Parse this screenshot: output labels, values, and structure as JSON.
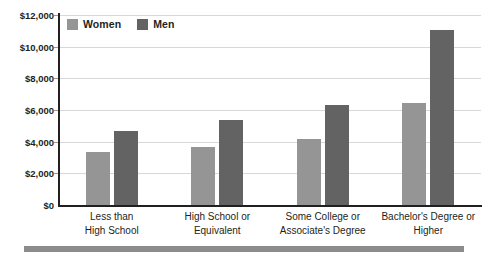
{
  "chart_data": {
    "type": "bar",
    "title": "",
    "subtitle": "",
    "xlabel": "",
    "ylabel": "",
    "ylim": [
      0,
      12000
    ],
    "ytick_values": [
      0,
      2000,
      4000,
      6000,
      8000,
      10000,
      12000
    ],
    "ytick_labels": [
      "$0",
      "$2,000",
      "$4,000",
      "$6,000",
      "$8,000",
      "$10,000",
      "$12,000"
    ],
    "grid": true,
    "legend_position": "top-left",
    "categories": [
      "Less than\nHigh School",
      "High School or\nEquivalent",
      "Some College or\nAssociate's Degree",
      "Bachelor's Degree or\nHigher"
    ],
    "category_lines": [
      [
        "Less than",
        "High School"
      ],
      [
        "High School or",
        "Equivalent"
      ],
      [
        "Some College or",
        "Associate's Degree"
      ],
      [
        "Bachelor's Degree or",
        "Higher"
      ]
    ],
    "series": [
      {
        "name": "Women",
        "color": "#959595",
        "values": [
          3350,
          3650,
          4200,
          6450
        ]
      },
      {
        "name": "Men",
        "color": "#636363",
        "values": [
          4670,
          5350,
          6300,
          11050
        ]
      }
    ]
  },
  "legend": {
    "items": [
      {
        "label": "Women",
        "color": "#959595"
      },
      {
        "label": "Men",
        "color": "#636363"
      }
    ]
  },
  "colors": {
    "women": "#959595",
    "men": "#636363",
    "axis": "#231f20",
    "gridline": "#d8d8d8",
    "rule": "#8c8c8c",
    "background": "#ffffff"
  }
}
